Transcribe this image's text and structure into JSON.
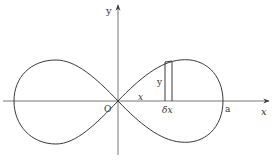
{
  "diagram": {
    "type": "lemniscate-area-element",
    "curve": "lemniscate (figure-eight) symmetric about both axes",
    "colors": {
      "stroke": "#3a3a3a",
      "background": "#ffffff",
      "text": "#333333"
    },
    "labels": {
      "y_axis": "y",
      "x_axis": "x",
      "origin": "O",
      "x_distance": "x",
      "strip_height": "y",
      "strip_width": "δx",
      "intercept": "a"
    }
  }
}
